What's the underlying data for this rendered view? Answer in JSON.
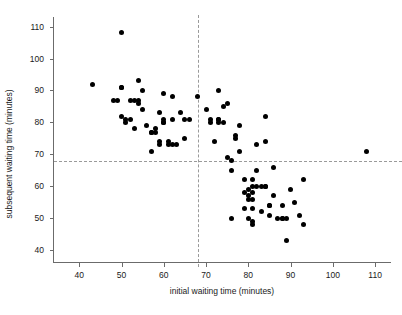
{
  "chart_data": {
    "type": "scatter",
    "title": "",
    "xlabel": "initial waiting time (minutes)",
    "ylabel": "subsequent waiting time (minutes)",
    "xlim": [
      34,
      114
    ],
    "ylim": [
      36,
      113
    ],
    "xticks": [
      40,
      50,
      60,
      70,
      80,
      90,
      100,
      110
    ],
    "xticklabels": [
      "40",
      "50",
      "60",
      "70",
      "80",
      "90",
      "100",
      "110"
    ],
    "yticks": [
      40,
      50,
      60,
      70,
      80,
      90,
      100,
      110
    ],
    "yticklabels": [
      "40",
      "50",
      "60",
      "70",
      "80",
      "90",
      "100",
      "110"
    ],
    "grid": false,
    "legend": null,
    "marker": {
      "shape": "circle",
      "color": "#000000",
      "size": 5
    },
    "reference_lines": [
      {
        "orientation": "horizontal",
        "value": 68,
        "style": "dashed",
        "color": "#9a9a9a"
      },
      {
        "orientation": "vertical",
        "value": 68,
        "style": "dashed",
        "color": "#9a9a9a"
      }
    ],
    "points": [
      [
        43,
        92
      ],
      [
        50,
        108
      ],
      [
        48,
        87
      ],
      [
        49,
        87
      ],
      [
        50,
        91
      ],
      [
        50,
        91
      ],
      [
        51,
        80
      ],
      [
        51,
        81
      ],
      [
        52,
        81
      ],
      [
        50,
        82
      ],
      [
        52,
        87
      ],
      [
        53,
        87
      ],
      [
        54,
        86
      ],
      [
        54,
        87
      ],
      [
        53,
        78
      ],
      [
        54,
        93
      ],
      [
        55,
        84
      ],
      [
        55,
        90
      ],
      [
        56,
        79
      ],
      [
        57,
        71
      ],
      [
        57,
        77
      ],
      [
        57,
        77
      ],
      [
        58,
        77
      ],
      [
        58,
        78
      ],
      [
        59,
        83
      ],
      [
        59,
        74
      ],
      [
        59,
        73
      ],
      [
        60,
        89
      ],
      [
        60,
        80
      ],
      [
        60,
        80
      ],
      [
        60,
        81
      ],
      [
        61,
        74
      ],
      [
        61,
        73
      ],
      [
        62,
        88
      ],
      [
        62,
        81
      ],
      [
        62,
        73
      ],
      [
        63,
        73
      ],
      [
        64,
        83
      ],
      [
        65,
        75
      ],
      [
        65,
        81
      ],
      [
        66,
        81
      ],
      [
        68,
        88
      ],
      [
        70,
        84
      ],
      [
        71,
        80
      ],
      [
        71,
        81
      ],
      [
        72,
        74
      ],
      [
        73,
        90
      ],
      [
        73,
        81
      ],
      [
        73,
        81
      ],
      [
        73,
        80
      ],
      [
        74,
        85
      ],
      [
        74,
        80
      ],
      [
        75,
        86
      ],
      [
        75,
        69
      ],
      [
        76,
        68
      ],
      [
        76,
        65
      ],
      [
        76,
        50
      ],
      [
        77,
        76
      ],
      [
        77,
        75
      ],
      [
        78,
        79
      ],
      [
        78,
        71
      ],
      [
        79,
        62
      ],
      [
        79,
        58
      ],
      [
        79,
        53
      ],
      [
        80,
        59
      ],
      [
        80,
        57
      ],
      [
        80,
        56
      ],
      [
        80,
        50
      ],
      [
        81,
        62
      ],
      [
        81,
        60
      ],
      [
        81,
        58
      ],
      [
        81,
        56
      ],
      [
        81,
        53
      ],
      [
        81,
        49
      ],
      [
        81,
        48
      ],
      [
        82,
        65
      ],
      [
        82,
        60
      ],
      [
        82,
        73
      ],
      [
        83,
        60
      ],
      [
        83,
        52
      ],
      [
        84,
        82
      ],
      [
        84,
        74
      ],
      [
        84,
        60
      ],
      [
        84,
        60
      ],
      [
        85,
        54
      ],
      [
        85,
        54
      ],
      [
        85,
        51
      ],
      [
        86,
        66
      ],
      [
        86,
        57
      ],
      [
        87,
        50
      ],
      [
        88,
        50
      ],
      [
        88,
        50
      ],
      [
        88,
        54
      ],
      [
        89,
        43
      ],
      [
        89,
        50
      ],
      [
        90,
        59
      ],
      [
        91,
        55
      ],
      [
        92,
        51
      ],
      [
        93,
        62
      ],
      [
        93,
        48
      ],
      [
        108,
        71
      ]
    ]
  },
  "axis": {
    "x_title": "initial waiting time (minutes)",
    "y_title": "subsequent waiting time (minutes)"
  }
}
